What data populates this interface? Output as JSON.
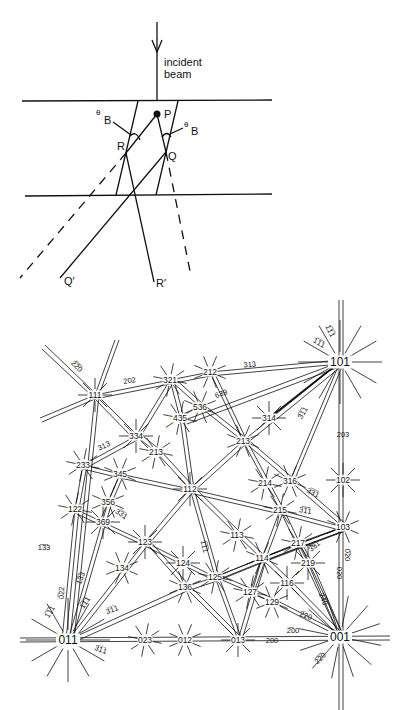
{
  "ray_diagram": {
    "incident_label_line1": "incident",
    "incident_label_line2": "beam",
    "point_P": "P",
    "point_R": "R",
    "point_Q": "Q",
    "point_Q_prime": "Q′",
    "point_R_prime": "R′",
    "theta": "θ",
    "theta_sub": "B",
    "colors": {
      "line": "#111111",
      "background": "#ffffff"
    }
  },
  "kikuchi_map": {
    "poles": [
      {
        "label": "111",
        "x": 95,
        "y": 395
      },
      {
        "label": "321",
        "x": 170,
        "y": 380
      },
      {
        "label": "212",
        "x": 210,
        "y": 372
      },
      {
        "label": "101",
        "x": 340,
        "y": 362,
        "big": true
      },
      {
        "label": "435",
        "x": 180,
        "y": 418
      },
      {
        "label": "536",
        "x": 200,
        "y": 407
      },
      {
        "label": "334",
        "x": 136,
        "y": 436
      },
      {
        "label": "213",
        "x": 156,
        "y": 452
      },
      {
        "label": "213",
        "x": 243,
        "y": 441
      },
      {
        "label": "314",
        "x": 269,
        "y": 418
      },
      {
        "label": "233",
        "x": 83,
        "y": 465
      },
      {
        "label": "345",
        "x": 120,
        "y": 474
      },
      {
        "label": "112",
        "x": 190,
        "y": 489
      },
      {
        "label": "214",
        "x": 265,
        "y": 483
      },
      {
        "label": "316",
        "x": 290,
        "y": 481
      },
      {
        "label": "102",
        "x": 343,
        "y": 480
      },
      {
        "label": "122",
        "x": 75,
        "y": 509
      },
      {
        "label": "356",
        "x": 108,
        "y": 502
      },
      {
        "label": "369",
        "x": 103,
        "y": 522
      },
      {
        "label": "215",
        "x": 280,
        "y": 510
      },
      {
        "label": "103",
        "x": 343,
        "y": 527
      },
      {
        "label": "123",
        "x": 145,
        "y": 542
      },
      {
        "label": "113",
        "x": 237,
        "y": 535
      },
      {
        "label": "134",
        "x": 122,
        "y": 568
      },
      {
        "label": "124",
        "x": 183,
        "y": 563
      },
      {
        "label": "217",
        "x": 298,
        "y": 543
      },
      {
        "label": "114",
        "x": 262,
        "y": 558
      },
      {
        "label": "219",
        "x": 308,
        "y": 563
      },
      {
        "label": "125",
        "x": 215,
        "y": 577
      },
      {
        "label": "136",
        "x": 185,
        "y": 587
      },
      {
        "label": "116",
        "x": 287,
        "y": 583
      },
      {
        "label": "127",
        "x": 250,
        "y": 592
      },
      {
        "label": "129",
        "x": 272,
        "y": 602
      },
      {
        "label": "011",
        "x": 68,
        "y": 640,
        "big": true
      },
      {
        "label": "023",
        "x": 145,
        "y": 640
      },
      {
        "label": "012",
        "x": 185,
        "y": 640
      },
      {
        "label": "013",
        "x": 238,
        "y": 640
      },
      {
        "label": "001",
        "x": 340,
        "y": 637,
        "big": true
      }
    ],
    "band_labels": [
      {
        "label": "2̅2̅0",
        "x": 75,
        "y": 368,
        "rot": 45
      },
      {
        "label": "202",
        "x": 130,
        "y": 383,
        "rot": -10
      },
      {
        "label": "313",
        "x": 250,
        "y": 367,
        "rot": -5
      },
      {
        "label": "1̅1̅1",
        "x": 328,
        "y": 332,
        "rot": 65
      },
      {
        "label": "1̅1̅1",
        "x": 318,
        "y": 345,
        "rot": 30
      },
      {
        "label": "639",
        "x": 222,
        "y": 396,
        "rot": -20
      },
      {
        "label": "3̅1̅1",
        "x": 305,
        "y": 414,
        "rot": -60
      },
      {
        "label": "203",
        "x": 343,
        "y": 437,
        "rot": 0
      },
      {
        "label": "313",
        "x": 105,
        "y": 448,
        "rot": -25
      },
      {
        "label": "3̅3̅1",
        "x": 312,
        "y": 495,
        "rot": 25
      },
      {
        "label": "3̅1̅1",
        "x": 305,
        "y": 513,
        "rot": 10
      },
      {
        "label": "3̅3̅1",
        "x": 120,
        "y": 516,
        "rot": 35
      },
      {
        "label": "1̅3̅3",
        "x": 44,
        "y": 550,
        "rot": 0
      },
      {
        "label": "1̅1̅1",
        "x": 202,
        "y": 547,
        "rot": 75
      },
      {
        "label": "3̅3̅1",
        "x": 316,
        "y": 548,
        "rot": -40
      },
      {
        "label": "0̅20",
        "x": 345,
        "y": 555,
        "rot": 90
      },
      {
        "label": "020",
        "x": 337,
        "y": 573,
        "rot": 90
      },
      {
        "label": "1̅3̅3",
        "x": 83,
        "y": 579,
        "rot": -70
      },
      {
        "label": "0̅22",
        "x": 64,
        "y": 593,
        "rot": -88
      },
      {
        "label": "1̅1̅1",
        "x": 87,
        "y": 604,
        "rot": -55
      },
      {
        "label": "1̅1̅1",
        "x": 52,
        "y": 613,
        "rot": -60
      },
      {
        "label": "3̅1̅1",
        "x": 113,
        "y": 612,
        "rot": -20
      },
      {
        "label": "2̅40",
        "x": 321,
        "y": 600,
        "rot": 70
      },
      {
        "label": "2̅20",
        "x": 305,
        "y": 618,
        "rot": 20
      },
      {
        "label": "2̅00",
        "x": 293,
        "y": 633,
        "rot": 0
      },
      {
        "label": "200",
        "x": 272,
        "y": 643,
        "rot": 0
      },
      {
        "label": "3̅1̅1",
        "x": 100,
        "y": 652,
        "rot": 20
      },
      {
        "label": "2̅2̅0",
        "x": 322,
        "y": 660,
        "rot": -45
      }
    ]
  }
}
